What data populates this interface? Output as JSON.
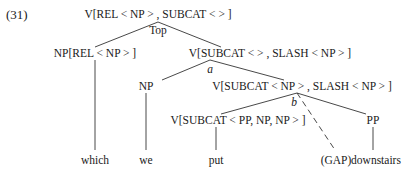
{
  "example_number": "(31)",
  "tree": {
    "root": {
      "label": "V[REL < NP > , SUBCAT < > ]",
      "edge_label": "Top"
    },
    "np_rel": {
      "label": "NP[REL < NP > ]"
    },
    "v_slash": {
      "label": "V[SUBCAT < > , SLASH < NP > ]",
      "edge_label": "a"
    },
    "np": {
      "label": "NP"
    },
    "v_subcat_np": {
      "label": "V[SUBCAT < NP > , SLASH < NP > ]",
      "edge_label": "b"
    },
    "v_subcat3": {
      "label": "V[SUBCAT < PP, NP, NP > ]"
    },
    "pp": {
      "label": "PP"
    },
    "leaves": {
      "which": "which",
      "we": "we",
      "put": "put",
      "gap": "(GAP)",
      "downstairs": "downstairs"
    }
  }
}
